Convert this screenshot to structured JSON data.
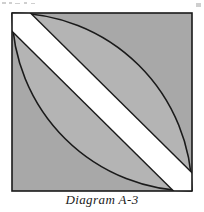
{
  "figure": {
    "caption": "Diagram A-3",
    "shape_name": "square-with-vesica-and-diagonal-band",
    "colors": {
      "background": "#ffffff",
      "outer_fill": "#a8a8a8",
      "lens_fill": "#b4b4b4",
      "stroke": "#1a1a1a",
      "band_fill": "#ffffff",
      "speck": "#cfcfcf"
    },
    "square": {
      "top_left_x": 12,
      "top_left_y": 13,
      "top_right_x": 192,
      "top_right_y": 13,
      "bottom_right_x": 192,
      "bottom_right_y": 191,
      "bottom_left_x": 12,
      "bottom_left_y": 191,
      "stroke_width": 1.6
    },
    "arcs": [
      {
        "name": "arc-centered-bottom-left",
        "center_x": 12,
        "center_y": 191,
        "radius": 180,
        "from_x": 192,
        "from_y": 191,
        "to_x": 12,
        "to_y": 13
      },
      {
        "name": "arc-centered-top-right",
        "center_x": 192,
        "center_y": 13,
        "radius": 180,
        "from_x": 12,
        "from_y": 13,
        "to_x": 192,
        "to_y": 191
      }
    ],
    "band": {
      "name": "white-diagonal-band",
      "from_corner": "top-left",
      "to_corner": "bottom-right",
      "width": 26,
      "fill": "#ffffff"
    },
    "specks": [
      {
        "x": 2,
        "y": 2,
        "w": 4,
        "h": 2
      },
      {
        "x": 9,
        "y": 2,
        "w": 3,
        "h": 2
      },
      {
        "x": 15,
        "y": 3,
        "w": 5,
        "h": 1
      },
      {
        "x": 24,
        "y": 2,
        "w": 3,
        "h": 2
      },
      {
        "x": 31,
        "y": 3,
        "w": 4,
        "h": 1
      },
      {
        "x": 196,
        "y": 3,
        "w": 5,
        "h": 4
      }
    ]
  }
}
